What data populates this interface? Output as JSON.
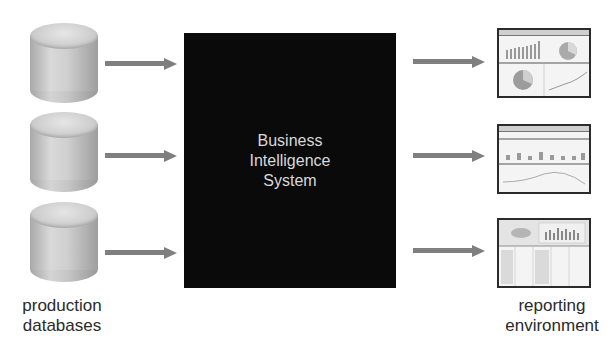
{
  "diagram": {
    "title": "Business Intelligence System",
    "center_box": {
      "lines": [
        "Business",
        "Intelligence",
        "System"
      ],
      "fill": "#0a0a0a",
      "text_color": "#d9d9d9"
    },
    "sources": {
      "label_lines": [
        "production",
        "databases"
      ],
      "items": [
        {
          "icon": "database-cylinder-icon"
        },
        {
          "icon": "database-cylinder-icon"
        },
        {
          "icon": "database-cylinder-icon"
        }
      ]
    },
    "outputs": {
      "label_lines": [
        "reporting",
        "environment"
      ],
      "items": [
        {
          "icon": "dashboard-report-icon",
          "content": "bar chart, pie charts, line chart"
        },
        {
          "icon": "dashboard-report-icon",
          "content": "small bar series and wave chart"
        },
        {
          "icon": "dashboard-report-icon",
          "content": "table grid with bar chart"
        }
      ]
    },
    "arrow_color": "#7f7f7f",
    "edges": [
      {
        "from": "database-1",
        "to": "bi-system"
      },
      {
        "from": "database-2",
        "to": "bi-system"
      },
      {
        "from": "database-3",
        "to": "bi-system"
      },
      {
        "from": "bi-system",
        "to": "report-1"
      },
      {
        "from": "bi-system",
        "to": "report-2"
      },
      {
        "from": "bi-system",
        "to": "report-3"
      }
    ]
  }
}
